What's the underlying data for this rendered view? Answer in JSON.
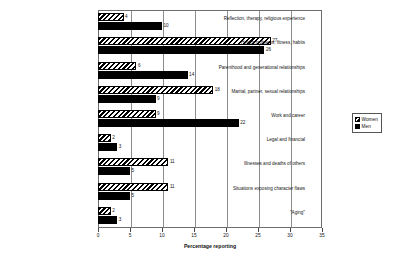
{
  "chart_data": {
    "type": "bar",
    "orientation": "horizontal",
    "title": "",
    "xlabel": "Percentage reporting",
    "ylabel": "",
    "xlim": [
      0,
      35
    ],
    "xticks": [
      0,
      5,
      10,
      15,
      20,
      25,
      30,
      35
    ],
    "grid": true,
    "legend_position": "right",
    "categories": [
      "Reflection, therapy, religious experience",
      "Health problems, fitness, habits",
      "Parenthood and generational relationships",
      "Marital, partner, sexual relationships",
      "Work and career",
      "Legal and financial",
      "Illnesses and deaths of others",
      "Situations exposing character flaws",
      "\"Aging\""
    ],
    "series": [
      {
        "name": "Women",
        "fill": "hatched",
        "values": [
          4,
          27,
          6,
          18,
          9,
          2,
          11,
          11,
          2
        ]
      },
      {
        "name": "Men",
        "fill": "solid-black",
        "values": [
          10,
          26,
          14,
          9,
          22,
          3,
          5,
          5,
          3
        ]
      }
    ]
  },
  "legend": {
    "items": [
      {
        "label": "Women",
        "swatch": "hatched-swatch-icon"
      },
      {
        "label": "Men",
        "swatch": "solid-swatch-icon"
      }
    ]
  },
  "colors": {
    "bar_outline": "#000000",
    "men_fill": "#000000",
    "women_fill": "#ffffff",
    "gridline": "#8c8c8c",
    "frame": "#6e6e6e",
    "background": "#ffffff",
    "text": "#151515"
  }
}
